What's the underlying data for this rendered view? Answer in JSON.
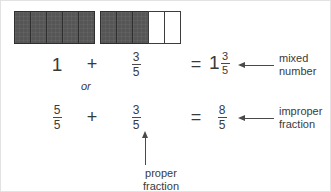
{
  "diagram": {
    "colors": {
      "shaded": "#565656",
      "cell_border": "#3c3c3c",
      "text": "#3a3a3a",
      "arrow": "#4a4a4a",
      "background": "#ffffff"
    },
    "bars": [
      {
        "name": "whole-bar",
        "total_cells": 5,
        "shaded_cells": 5,
        "value_label": "1"
      },
      {
        "name": "partial-bar",
        "total_cells": 5,
        "shaded_cells": 3,
        "value_label": "3/5"
      }
    ],
    "row_mixed": {
      "term1": "1",
      "operator": "+",
      "term2": {
        "numerator": "3",
        "denominator": "5"
      },
      "equals": "=",
      "result": {
        "whole": "1",
        "numerator": "3",
        "denominator": "5"
      }
    },
    "or_label": "or",
    "row_improper": {
      "term1": {
        "numerator": "5",
        "denominator": "5"
      },
      "operator": "+",
      "term2": {
        "numerator": "3",
        "denominator": "5"
      },
      "equals": "=",
      "result": {
        "numerator": "8",
        "denominator": "5"
      }
    },
    "callouts": [
      {
        "name": "mixed-number",
        "line1": "mixed",
        "line2": "number",
        "arrow": "arrow-left-icon"
      },
      {
        "name": "improper-fraction",
        "line1": "improper",
        "line2": "fraction",
        "arrow": "arrow-left-icon"
      },
      {
        "name": "proper-fraction",
        "text": "proper fraction",
        "arrow": "arrow-up-icon"
      }
    ]
  }
}
